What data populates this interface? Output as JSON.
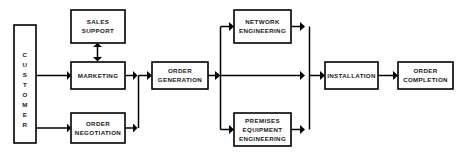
{
  "diagram": {
    "type": "flowchart",
    "background_color": "#ffffff",
    "line_color": "#000000",
    "text_color": "#1a1a1a",
    "nodes": [
      {
        "id": "customer",
        "label": "CUSTOMER",
        "letters": [
          "C",
          "U",
          "S",
          "T",
          "O",
          "M",
          "E",
          "R"
        ],
        "orientation": "vertical",
        "x": 14,
        "y": 25,
        "w": 22,
        "h": 118
      },
      {
        "id": "sales-support",
        "label": "SALES SUPPORT",
        "lines": [
          "SALES",
          "SUPPORT"
        ],
        "orientation": "horizontal",
        "x": 71,
        "y": 10,
        "w": 54,
        "h": 33
      },
      {
        "id": "marketing",
        "label": "MARKETING",
        "lines": [
          "MARKETING"
        ],
        "orientation": "horizontal",
        "x": 71,
        "y": 62,
        "w": 54,
        "h": 27
      },
      {
        "id": "order-negotiation",
        "label": "ORDER NEGOTIATION",
        "lines": [
          "ORDER",
          "NEGOTIATION"
        ],
        "orientation": "horizontal",
        "x": 71,
        "y": 113,
        "w": 54,
        "h": 30
      },
      {
        "id": "order-generation",
        "label": "ORDER GENERATION",
        "lines": [
          "ORDER",
          "GENERATION"
        ],
        "orientation": "horizontal",
        "x": 152,
        "y": 62,
        "w": 56,
        "h": 27
      },
      {
        "id": "network-engineering",
        "label": "NETWORK ENGINEERING",
        "lines": [
          "NETWORK",
          "ENGINEERING"
        ],
        "orientation": "horizontal",
        "x": 234,
        "y": 10,
        "w": 57,
        "h": 33
      },
      {
        "id": "premises-equipment-engineering",
        "label": "PREMISES EQUIPMENT ENGINEERING",
        "lines": [
          "PREMISES",
          "EQUIPMENT",
          "ENGINEERING"
        ],
        "orientation": "horizontal",
        "x": 234,
        "y": 113,
        "w": 57,
        "h": 33
      },
      {
        "id": "installation",
        "label": "INSTALLATION",
        "lines": [
          "INSTALLATION"
        ],
        "orientation": "horizontal",
        "x": 325,
        "y": 62,
        "w": 53,
        "h": 27
      },
      {
        "id": "order-completion",
        "label": "ORDER COMPLETION",
        "lines": [
          "ORDER",
          "COMPLETION"
        ],
        "orientation": "horizontal",
        "x": 398,
        "y": 62,
        "w": 55,
        "h": 27
      }
    ],
    "edges": [
      {
        "id": "customer-to-marketing",
        "from": "customer",
        "to": "marketing",
        "kind": "arrow"
      },
      {
        "id": "customer-to-order-negotiation",
        "from": "customer",
        "to": "order-negotiation",
        "kind": "arrow"
      },
      {
        "id": "marketing-to-sales-support",
        "from": "marketing",
        "to": "sales-support",
        "kind": "double-arrow"
      },
      {
        "id": "marketing-to-merge",
        "from": "marketing",
        "to": "order-generation",
        "kind": "arrow"
      },
      {
        "id": "order-negotiation-to-merge",
        "from": "order-negotiation",
        "to": "order-generation",
        "kind": "arrow"
      },
      {
        "id": "merge-to-order-generation",
        "from": "merge-left",
        "to": "order-generation",
        "kind": "arrow"
      },
      {
        "id": "order-generation-to-split",
        "from": "order-generation",
        "to": "split-right",
        "kind": "arrow"
      },
      {
        "id": "split-to-network-engineering",
        "from": "split-right",
        "to": "network-engineering",
        "kind": "arrow"
      },
      {
        "id": "split-to-premises",
        "from": "split-right",
        "to": "premises-equipment-engineering",
        "kind": "arrow"
      },
      {
        "id": "network-engineering-to-merge",
        "from": "network-engineering",
        "to": "merge-right",
        "kind": "arrow"
      },
      {
        "id": "premises-to-merge",
        "from": "premises-equipment-engineering",
        "to": "merge-right",
        "kind": "arrow"
      },
      {
        "id": "merge-to-installation",
        "from": "merge-right",
        "to": "installation",
        "kind": "arrow"
      },
      {
        "id": "installation-to-order-completion",
        "from": "installation",
        "to": "order-completion",
        "kind": "arrow"
      }
    ]
  }
}
